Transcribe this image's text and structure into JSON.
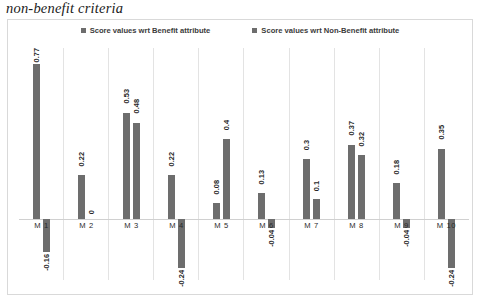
{
  "caption": "non-benefit criteria",
  "legend": {
    "position": "top-center",
    "entries": [
      {
        "label": "Score values wrt Benefit attribute",
        "color": "#6d6d6d"
      },
      {
        "label": "Score values wrt Non-Benefit attribute",
        "color": "#6d6d6d"
      }
    ]
  },
  "colors": {
    "bar_benefit": "#6d6d6d",
    "bar_non_benefit": "#6d6d6d",
    "gridline": "#e3e3e3",
    "axis": "#d0d0d0",
    "frame": "#d9d9d9",
    "label_text": "#262626"
  },
  "chart_data": {
    "type": "bar",
    "title": "non-benefit criteria",
    "xlabel": "",
    "ylabel": "",
    "ylim": [
      -0.3,
      0.85
    ],
    "grid": "vertical-category-separators",
    "legend_position": "top-center",
    "categories": [
      "M 1",
      "M 2",
      "M 3",
      "M 4",
      "M 5",
      "M 6",
      "M 7",
      "M 8",
      "M 9",
      "M 10"
    ],
    "series": [
      {
        "name": "Score values wrt Benefit attribute",
        "values": [
          0.77,
          0.22,
          0.53,
          0.22,
          0.08,
          0.13,
          0.3,
          0.37,
          0.18,
          0.35
        ],
        "labels": [
          "0.77",
          "0.22",
          "0.53",
          "0.22",
          "0.08",
          "0.13",
          "0.3",
          "0.37",
          "0.18",
          "0.35"
        ]
      },
      {
        "name": "Score values wrt Non-Benefit attribute",
        "values": [
          -0.16,
          0,
          0.48,
          -0.24,
          0.4,
          -0.04,
          0.1,
          0.32,
          -0.04,
          -0.24
        ],
        "labels": [
          "-0.16",
          "0",
          "0.48",
          "-0.24",
          "0.4",
          "-0.04",
          "0.1",
          "0.32",
          "-0.04",
          "-0.24"
        ]
      }
    ]
  }
}
